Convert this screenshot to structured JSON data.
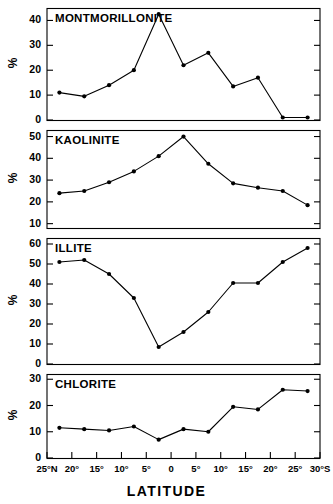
{
  "figure": {
    "xaxis_title": "LATITUDE",
    "y_axis_label": "%",
    "marker_color": "#000000",
    "line_color": "#000000",
    "frame_color": "#000000",
    "background_color": "#ffffff"
  },
  "chart_data": [
    {
      "type": "line",
      "title": "MONTMORILLONITE",
      "xlabel": "LATITUDE",
      "ylabel": "%",
      "x": [
        -22.5,
        -17.5,
        -12.5,
        -7.5,
        -2.5,
        2.5,
        7.5,
        12.5,
        17.5,
        22.5,
        27.5
      ],
      "categories": [
        "25-20°N",
        "20-15°N",
        "15-10°N",
        "10-5°N",
        "5°N-0",
        "0-5°S",
        "5-10°S",
        "10-15°S",
        "15-20°S",
        "20-25°S",
        "25-30°S"
      ],
      "values": [
        11,
        9.5,
        14,
        20,
        42.5,
        22,
        27,
        13.5,
        17,
        1,
        1
      ],
      "ylim": [
        0,
        45
      ],
      "yticks": [
        0,
        10,
        20,
        30,
        40
      ],
      "ytick_labels": [
        "0",
        "10",
        "20",
        "30",
        "40"
      ],
      "xlim": [
        -25,
        30
      ],
      "grid": false,
      "legend": false
    },
    {
      "type": "line",
      "title": "KAOLINITE",
      "xlabel": "LATITUDE",
      "ylabel": "%",
      "x": [
        -22.5,
        -17.5,
        -12.5,
        -7.5,
        -2.5,
        2.5,
        7.5,
        12.5,
        17.5,
        22.5,
        27.5
      ],
      "categories": [
        "25-20°N",
        "20-15°N",
        "15-10°N",
        "10-5°N",
        "5°N-0",
        "0-5°S",
        "5-10°S",
        "10-15°S",
        "15-20°S",
        "20-25°S",
        "25-30°S"
      ],
      "values": [
        24,
        25,
        29,
        34,
        41,
        50,
        37.5,
        28.5,
        26.5,
        25,
        18.5
      ],
      "ylim": [
        8,
        53
      ],
      "yticks": [
        10,
        20,
        30,
        40,
        50
      ],
      "ytick_labels": [
        "10",
        "20",
        "30",
        "40",
        "50"
      ],
      "xlim": [
        -25,
        30
      ],
      "grid": false,
      "legend": false
    },
    {
      "type": "line",
      "title": "ILLITE",
      "xlabel": "LATITUDE",
      "ylabel": "%",
      "x": [
        -22.5,
        -17.5,
        -12.5,
        -7.5,
        -2.5,
        2.5,
        7.5,
        12.5,
        17.5,
        22.5,
        27.5
      ],
      "categories": [
        "25-20°N",
        "20-15°N",
        "15-10°N",
        "10-5°N",
        "5°N-0",
        "0-5°S",
        "5-10°S",
        "10-15°S",
        "15-20°S",
        "20-25°S",
        "25-30°S"
      ],
      "values": [
        51,
        52,
        45,
        33,
        8.5,
        16,
        26,
        40.5,
        40.5,
        51,
        58
      ],
      "ylim": [
        0,
        63
      ],
      "yticks": [
        0,
        10,
        20,
        30,
        40,
        50,
        60
      ],
      "ytick_labels": [
        "0",
        "10",
        "20",
        "30",
        "40",
        "50",
        "60"
      ],
      "xlim": [
        -25,
        30
      ],
      "grid": false,
      "legend": false
    },
    {
      "type": "line",
      "title": "CHLORITE",
      "xlabel": "LATITUDE",
      "ylabel": "%",
      "x": [
        -22.5,
        -17.5,
        -12.5,
        -7.5,
        -2.5,
        2.5,
        7.5,
        12.5,
        17.5,
        22.5,
        27.5
      ],
      "categories": [
        "25-20°N",
        "20-15°N",
        "15-10°N",
        "10-5°N",
        "5°N-0",
        "0-5°S",
        "5-10°S",
        "10-15°S",
        "15-20°S",
        "20-25°S",
        "25-30°S"
      ],
      "values": [
        11.5,
        11,
        10.5,
        12,
        7,
        11,
        10,
        19.5,
        18.5,
        26,
        25.5
      ],
      "ylim": [
        0,
        32
      ],
      "yticks": [
        0,
        10,
        20,
        30
      ],
      "ytick_labels": [
        "0",
        "10",
        "20",
        "30"
      ],
      "xlim": [
        -25,
        30
      ],
      "grid": false,
      "legend": false
    }
  ],
  "xaxis": {
    "ticks": [
      -25,
      -20,
      -15,
      -10,
      -5,
      0,
      5,
      10,
      15,
      20,
      25,
      30
    ],
    "tick_labels": [
      "25°N",
      "20°",
      "15°",
      "10°",
      "5°",
      "0",
      "5°",
      "10°",
      "15°",
      "20°",
      "25°",
      "30°S"
    ]
  }
}
